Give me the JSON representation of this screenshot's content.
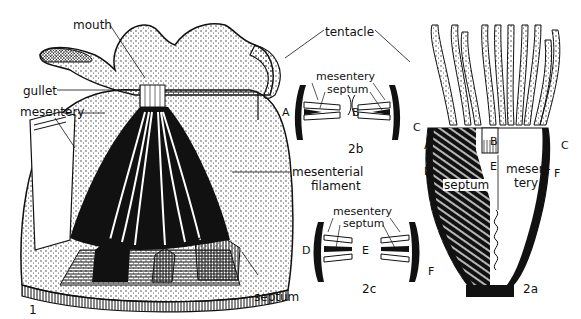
{
  "figure": {
    "panels": [
      {
        "id": "1",
        "label": "1",
        "description": "Cutaway 3D view of anemone body",
        "labels": {
          "mouth": "mouth",
          "gullet": "gullet",
          "mesentery": "mesentery",
          "tentacle": "tentacle",
          "mesenterial_filament_line1": "mesenterial",
          "mesenterial_filament_line2": "filament",
          "septum": "septum"
        }
      },
      {
        "id": "2a",
        "label": "2a",
        "description": "Vertical section of anemone",
        "labels": {
          "septum": "septum",
          "mesentery_line1": "mesen-",
          "mesentery_line2": "tery"
        },
        "letters": [
          "A",
          "B",
          "C",
          "D",
          "E",
          "F"
        ]
      },
      {
        "id": "2b",
        "label": "2b",
        "description": "Cross section at level A-B-C",
        "labels": {
          "mesentery": "mesentery",
          "septum": "septum"
        },
        "letters": [
          "A",
          "B",
          "C"
        ]
      },
      {
        "id": "2c",
        "label": "2c",
        "description": "Cross section at level D-E-F",
        "labels": {
          "mesentery": "mesentery",
          "septum": "septum"
        },
        "letters": [
          "D",
          "E",
          "F"
        ]
      }
    ]
  },
  "colors": {
    "ink": "#111111",
    "background": "#ffffff",
    "stipple": "#222222"
  }
}
